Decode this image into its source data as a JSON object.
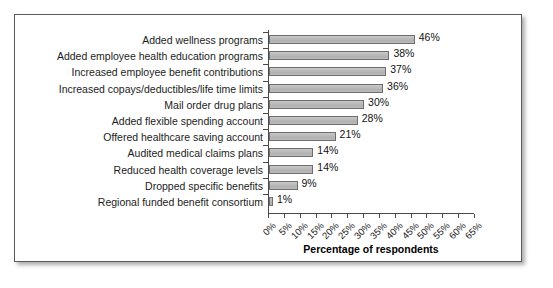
{
  "chart_data": {
    "type": "bar",
    "orientation": "horizontal",
    "title": "",
    "xlabel": "Percentage of respondents",
    "ylabel": "",
    "xlim": [
      0,
      65
    ],
    "grid": false,
    "legend": "none",
    "xtick_labels": [
      "0%",
      "5%",
      "10%",
      "15%",
      "20%",
      "25%",
      "30%",
      "35%",
      "40%",
      "45%",
      "50%",
      "55%",
      "60%",
      "65%"
    ],
    "xtick_values": [
      0,
      5,
      10,
      15,
      20,
      25,
      30,
      35,
      40,
      45,
      50,
      55,
      60,
      65
    ],
    "categories": [
      "Added wellness programs",
      "Added employee health education programs",
      "Increased employee benefit contributions",
      "Increased copays/deductibles/life time limits",
      "Mail order drug plans",
      "Added flexible spending account",
      "Offered healthcare saving account",
      "Audited medical claims plans",
      "Reduced health coverage levels",
      "Dropped specific benefits",
      "Regional funded benefit consortium"
    ],
    "values": [
      46,
      38,
      37,
      36,
      30,
      28,
      21,
      14,
      14,
      9,
      1
    ],
    "value_labels": [
      "46%",
      "38%",
      "37%",
      "36%",
      "30%",
      "28%",
      "21%",
      "14%",
      "14%",
      "9%",
      "1%"
    ],
    "colors": {
      "bar_fill": "#bcbcbc",
      "bar_border": "#6e6e6e",
      "axis": "#4a4a4a",
      "text": "#1c1c1c",
      "frame": "#5a5a5a",
      "background": "#ffffff"
    }
  }
}
